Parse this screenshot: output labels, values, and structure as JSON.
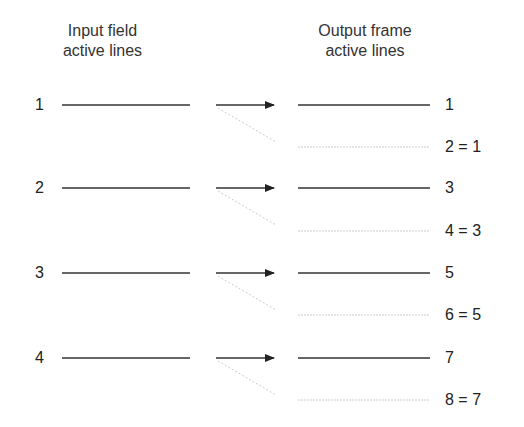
{
  "headers": {
    "input_line1": "Input field",
    "input_line2": "active lines",
    "output_line1": "Output frame",
    "output_line2": "active lines"
  },
  "input_lines": [
    "1",
    "2",
    "3",
    "4"
  ],
  "output_lines": [
    "1",
    "2 = 1",
    "3",
    "4 = 3",
    "5",
    "6 = 5",
    "7",
    "8 = 7"
  ],
  "colors": {
    "solid": "#333333",
    "faded": "#c8c8c8"
  }
}
